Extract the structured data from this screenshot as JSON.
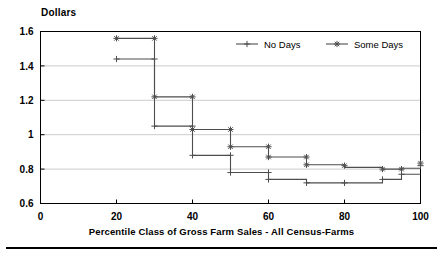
{
  "figure": {
    "ylabel": "Dollars",
    "xtitle": "Percentile Class of Gross Farm Sales - All Census-Farms"
  },
  "axes": {
    "y_ticks": [
      "1.6",
      "1.4",
      "1.2",
      "1",
      "0.8",
      "0.6"
    ],
    "x_ticks": [
      "0",
      "20",
      "40",
      "60",
      "80",
      "100"
    ]
  },
  "legend": {
    "entries": [
      {
        "label": "No Days",
        "marker": "plus-marker"
      },
      {
        "label": "Some Days",
        "marker": "asterisk-marker"
      }
    ]
  },
  "colors": {
    "line": "#4d4d4d",
    "frame": "#000000",
    "grid": "#cccccc",
    "text": "#000000"
  },
  "chart_data": {
    "type": "line",
    "title": "",
    "subtitle": "",
    "xlabel": "Percentile Class of Gross Farm Sales - All Census-Farms",
    "ylabel": "Dollars",
    "xlim": [
      0,
      100
    ],
    "ylim": [
      0.6,
      1.6
    ],
    "grid": true,
    "legend_position": "top-right",
    "style": "step-horizontal",
    "series": [
      {
        "name": "No Days",
        "marker": "plus",
        "points": [
          {
            "x": 20,
            "y": 1.44
          },
          {
            "x": 30,
            "y": 1.44
          },
          {
            "x": 30,
            "y": 1.05
          },
          {
            "x": 40,
            "y": 1.05
          },
          {
            "x": 40,
            "y": 0.88
          },
          {
            "x": 50,
            "y": 0.88
          },
          {
            "x": 50,
            "y": 0.78
          },
          {
            "x": 60,
            "y": 0.78
          },
          {
            "x": 60,
            "y": 0.74
          },
          {
            "x": 70,
            "y": 0.74
          },
          {
            "x": 70,
            "y": 0.72
          },
          {
            "x": 80,
            "y": 0.72
          },
          {
            "x": 80,
            "y": 0.72
          },
          {
            "x": 90,
            "y": 0.72
          },
          {
            "x": 90,
            "y": 0.74
          },
          {
            "x": 95,
            "y": 0.74
          },
          {
            "x": 95,
            "y": 0.77
          },
          {
            "x": 100,
            "y": 0.77
          }
        ],
        "markers_at": [
          {
            "x": 20,
            "y": 1.44
          },
          {
            "x": 30,
            "y": 1.44
          },
          {
            "x": 30,
            "y": 1.05
          },
          {
            "x": 40,
            "y": 1.05
          },
          {
            "x": 40,
            "y": 0.88
          },
          {
            "x": 50,
            "y": 0.88
          },
          {
            "x": 50,
            "y": 0.78
          },
          {
            "x": 60,
            "y": 0.78
          },
          {
            "x": 60,
            "y": 0.74
          },
          {
            "x": 70,
            "y": 0.72
          },
          {
            "x": 80,
            "y": 0.72
          },
          {
            "x": 90,
            "y": 0.74
          },
          {
            "x": 95,
            "y": 0.77
          },
          {
            "x": 100,
            "y": 0.82
          }
        ]
      },
      {
        "name": "Some Days",
        "marker": "asterisk",
        "points": [
          {
            "x": 20,
            "y": 1.56
          },
          {
            "x": 30,
            "y": 1.56
          },
          {
            "x": 30,
            "y": 1.22
          },
          {
            "x": 40,
            "y": 1.22
          },
          {
            "x": 40,
            "y": 1.03
          },
          {
            "x": 50,
            "y": 1.03
          },
          {
            "x": 50,
            "y": 0.93
          },
          {
            "x": 60,
            "y": 0.93
          },
          {
            "x": 60,
            "y": 0.87
          },
          {
            "x": 70,
            "y": 0.87
          },
          {
            "x": 70,
            "y": 0.825
          },
          {
            "x": 80,
            "y": 0.825
          },
          {
            "x": 80,
            "y": 0.81
          },
          {
            "x": 90,
            "y": 0.81
          },
          {
            "x": 90,
            "y": 0.8
          },
          {
            "x": 95,
            "y": 0.8
          },
          {
            "x": 95,
            "y": 0.805
          },
          {
            "x": 100,
            "y": 0.805
          }
        ],
        "markers_at": [
          {
            "x": 20,
            "y": 1.56
          },
          {
            "x": 30,
            "y": 1.56
          },
          {
            "x": 30,
            "y": 1.22
          },
          {
            "x": 40,
            "y": 1.22
          },
          {
            "x": 40,
            "y": 1.03
          },
          {
            "x": 50,
            "y": 1.03
          },
          {
            "x": 50,
            "y": 0.93
          },
          {
            "x": 60,
            "y": 0.93
          },
          {
            "x": 60,
            "y": 0.87
          },
          {
            "x": 70,
            "y": 0.87
          },
          {
            "x": 70,
            "y": 0.825
          },
          {
            "x": 80,
            "y": 0.82
          },
          {
            "x": 90,
            "y": 0.8
          },
          {
            "x": 95,
            "y": 0.8
          },
          {
            "x": 100,
            "y": 0.835
          }
        ]
      }
    ]
  }
}
